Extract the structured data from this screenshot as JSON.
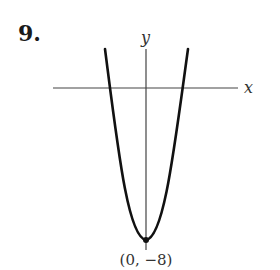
{
  "problem": {
    "number": "9."
  },
  "axes": {
    "x_label": "x",
    "y_label": "y"
  },
  "curve": {
    "type": "parabola",
    "opens": "up",
    "vertex": [
      0,
      -8
    ],
    "vertex_label": "(0, −8)"
  },
  "colors": {
    "curve": "#111111",
    "axes": "#444444",
    "text": "#333333"
  }
}
